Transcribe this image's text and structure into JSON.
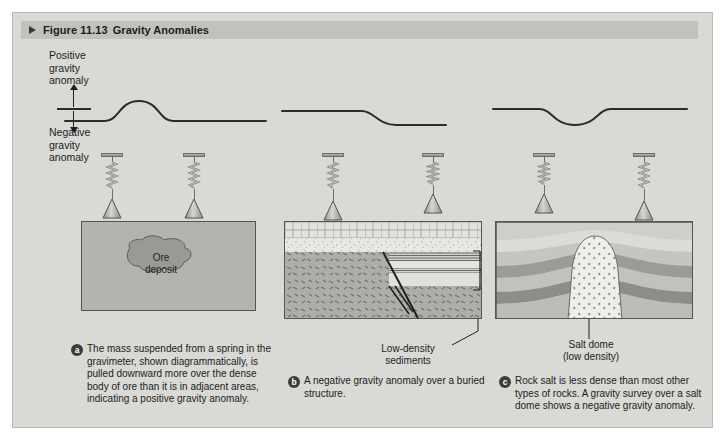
{
  "figure": {
    "marker_icon": "triangle-right-icon",
    "number": "Figure 11.13",
    "title": "Gravity Anomalies"
  },
  "axis": {
    "positive_label": "Positive\ngravity\nanomaly",
    "negative_label": "Negative\ngravity\nanomaly",
    "up_arrow_icon": "arrow-up-icon",
    "down_arrow_icon": "arrow-down-icon",
    "zero_line": "baseline"
  },
  "panels": [
    {
      "id": "a",
      "badge": "a",
      "curve_type": "positive-bump",
      "curve_description": "flat baseline with an upward bump over the centre",
      "gravimeter_count": 2,
      "gravimeter_icon": "gravimeter-spring-cone-icon",
      "block_label": "Ore\ndeposit",
      "caption": "The mass suspended from a spring in the gravimeter, shown diagrammatically, is pulled downward more over the dense body of ore than it is in adjacent areas, indicating a positive gravity anomaly."
    },
    {
      "id": "b",
      "badge": "b",
      "curve_type": "negative-step",
      "curve_description": "flat baseline stepping down to a lower level on the right",
      "gravimeter_count": 2,
      "gravimeter_icon": "gravimeter-spring-cone-icon",
      "block_label": "Low-density\nsediments",
      "caption": "A negative gravity anomaly over a buried structure."
    },
    {
      "id": "c",
      "badge": "c",
      "curve_type": "negative-trough",
      "curve_description": "flat baseline with a downward trough over the centre",
      "gravimeter_count": 2,
      "gravimeter_icon": "gravimeter-spring-cone-icon",
      "block_label": "Salt dome\n(low density)",
      "caption": "Rock salt is less dense than most other types of rocks. A gravity survey over a salt dome shows a negative gravity anomaly."
    }
  ],
  "colors": {
    "page_background": "#d9d9d6",
    "header_bar": "#c2c2bd",
    "curve_stroke": "#2b2b2b",
    "block_outline": "#55554f",
    "ore_body": "#9a9a95",
    "dense_rock": "#a2a29c",
    "light_sediment": "#dedeDA",
    "salt_dome": "#e6e6e2",
    "badge": "#3c3c3a"
  }
}
